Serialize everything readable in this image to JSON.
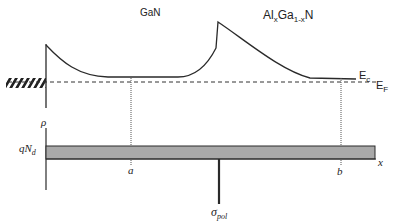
{
  "labels": {
    "gan": "GaN",
    "algan_al": "Al",
    "algan_x1": "x",
    "algan_ga": "Ga",
    "algan_sub": "1-x",
    "algan_n": "N",
    "ec_main": "E",
    "ec_sub": "c",
    "ef_main": "E",
    "ef_sub": "F",
    "rho": "ρ",
    "qnd_main": "qN",
    "qnd_sub": "d",
    "a": "a",
    "b": "b",
    "x_axis": "x",
    "sigma_main": "σ",
    "sigma_sub": "pol"
  },
  "colors": {
    "line": "#2a2a2a",
    "charge_fill": "#a9a9a9",
    "dotted": "#555555"
  }
}
